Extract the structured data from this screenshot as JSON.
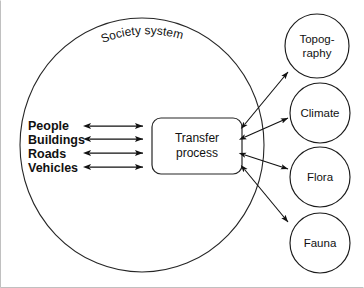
{
  "diagram": {
    "title": "Society system",
    "system_boundary": {
      "label": "Society system",
      "shape": "circle"
    },
    "process": {
      "line1": "Transfer",
      "line2": "process",
      "shape": "rounded-rectangle"
    },
    "inputs": [
      {
        "label": "People",
        "arrow": "double-headed"
      },
      {
        "label": "Buildings",
        "arrow": "double-headed"
      },
      {
        "label": "Roads",
        "arrow": "double-headed"
      },
      {
        "label": "Vehicles",
        "arrow": "double-headed"
      }
    ],
    "environment_nodes": [
      {
        "line1": "Topog-",
        "line2": "raphy",
        "arrow": "double-headed"
      },
      {
        "line1": "Climate",
        "line2": "",
        "arrow": "double-headed"
      },
      {
        "line1": "Flora",
        "line2": "",
        "arrow": "double-headed"
      },
      {
        "line1": "Fauna",
        "line2": "",
        "arrow": "double-headed"
      }
    ],
    "colors": {
      "stroke": "#111111",
      "background": "#ffffff",
      "text": "#111111"
    }
  }
}
